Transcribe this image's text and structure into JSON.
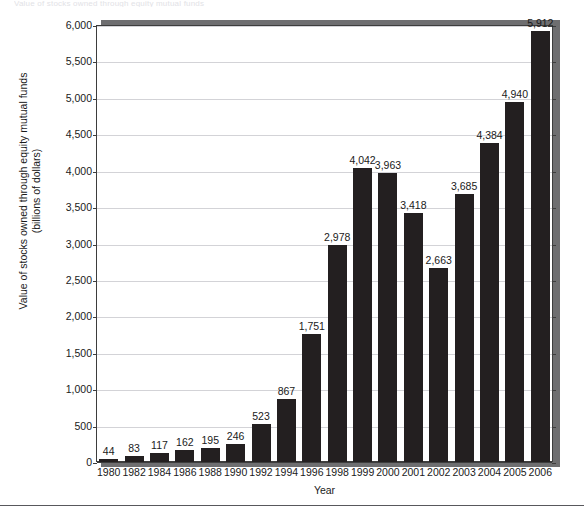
{
  "figure": {
    "cutoff_title_fragment": "Value of stocks owned through equity mutual funds",
    "background_color": "#ffffff",
    "bar_color": "#231f20",
    "grid_color": "#d3d3d7",
    "axis_color": "#3d3d3d",
    "shadow_color": "#6e6e70"
  },
  "chart_data": {
    "type": "bar",
    "title": "",
    "xlabel": "Year",
    "ylabel": "Value of stocks owned through equity mutual funds (billions of dollars)",
    "ylabel_line1": "Value of stocks owned through equity mutual funds",
    "ylabel_line2": "(billions of dollars)",
    "categories": [
      "1980",
      "1982",
      "1984",
      "1986",
      "1988",
      "1990",
      "1992",
      "1994",
      "1996",
      "1998",
      "1999",
      "2000",
      "2001",
      "2002",
      "2003",
      "2004",
      "2005",
      "2006"
    ],
    "values": [
      44,
      83,
      117,
      162,
      195,
      246,
      523,
      867,
      1751,
      2978,
      4042,
      3963,
      3418,
      2663,
      3685,
      4384,
      4940,
      5912
    ],
    "value_labels": [
      "44",
      "83",
      "117",
      "162",
      "195",
      "246",
      "523",
      "867",
      "1,751",
      "2,978",
      "4,042",
      "3,963",
      "3,418",
      "2,663",
      "3,685",
      "4,384",
      "4,940",
      "5,912"
    ],
    "ylim": [
      0,
      6000
    ],
    "ytick_values": [
      0,
      500,
      1000,
      1500,
      2000,
      2500,
      3000,
      3500,
      4000,
      4500,
      5000,
      5500,
      6000
    ],
    "ytick_labels": [
      "0",
      "500",
      "1,000",
      "1,500",
      "2,000",
      "2,500",
      "3,000",
      "3,500",
      "4,000",
      "4,500",
      "5,000",
      "5,500",
      "6,000"
    ],
    "grid": "horizontal",
    "legend": "none",
    "units": "billions of dollars",
    "data_labels": "above each bar"
  }
}
